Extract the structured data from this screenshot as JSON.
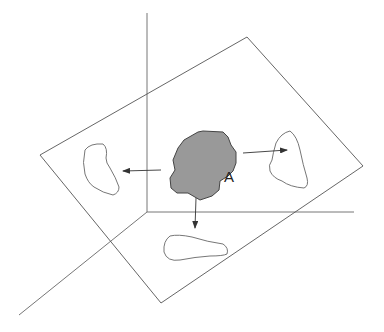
{
  "diagram": {
    "object_label": "A",
    "colors": {
      "line": "#555555",
      "object_fill": "#999999",
      "object_stroke": "#444444",
      "background": "#ffffff"
    },
    "axes": {
      "origin": [
        147,
        212
      ],
      "vertical_end": [
        147,
        13
      ],
      "horizontal_end": [
        354,
        212
      ],
      "diagonal_end": [
        19,
        315
      ]
    },
    "plane": [
      [
        247,
        37
      ],
      [
        363,
        166
      ],
      [
        161,
        303
      ],
      [
        40,
        155
      ]
    ],
    "projections": [
      "left-projection",
      "right-projection",
      "bottom-projection"
    ]
  }
}
